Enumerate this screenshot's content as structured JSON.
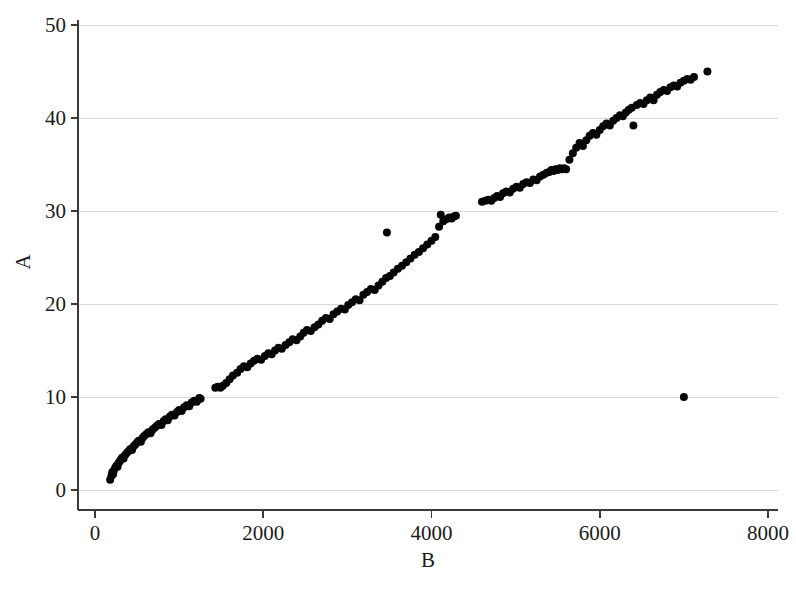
{
  "chart_data": {
    "type": "scatter",
    "title": "",
    "xlabel": "B",
    "ylabel": "A",
    "xlim": [
      0,
      8000
    ],
    "ylim": [
      0,
      50
    ],
    "xticks": [
      0,
      2000,
      4000,
      6000,
      8000
    ],
    "yticks": [
      0,
      10,
      20,
      30,
      40,
      50
    ],
    "xtick_labels": [
      "0",
      "2000",
      "4000",
      "6000",
      "8000"
    ],
    "ytick_labels": [
      "0",
      "10",
      "20",
      "30",
      "40",
      "50"
    ],
    "grid": "horizontal",
    "legend": "none",
    "marker": {
      "shape": "circle",
      "color": "#060606",
      "size_px": 8
    },
    "series": [
      {
        "name": "A vs B",
        "x": [
          180,
          195,
          205,
          215,
          225,
          240,
          255,
          268,
          280,
          295,
          310,
          325,
          340,
          360,
          380,
          400,
          420,
          440,
          460,
          480,
          500,
          520,
          545,
          565,
          585,
          610,
          635,
          660,
          685,
          710,
          735,
          760,
          790,
          815,
          840,
          865,
          890,
          915,
          945,
          975,
          1000,
          1030,
          1060,
          1090,
          1120,
          1150,
          1180,
          1210,
          1240,
          1255,
          1430,
          1460,
          1490,
          1520,
          1560,
          1600,
          1640,
          1690,
          1730,
          1770,
          1810,
          1850,
          1890,
          1930,
          1975,
          2020,
          2060,
          2100,
          2140,
          2180,
          2220,
          2265,
          2310,
          2350,
          2395,
          2440,
          2480,
          2520,
          2565,
          2610,
          2655,
          2700,
          2745,
          2790,
          2835,
          2880,
          2925,
          2970,
          3010,
          3055,
          3100,
          3145,
          3190,
          3235,
          3280,
          3325,
          3370,
          3415,
          3460,
          3470,
          3505,
          3550,
          3600,
          3650,
          3700,
          3750,
          3800,
          3850,
          3900,
          3950,
          4000,
          4045,
          4090,
          4110,
          4140,
          4175,
          4210,
          4240,
          4265,
          4290,
          4600,
          4640,
          4675,
          4710,
          4745,
          4780,
          4815,
          4850,
          4890,
          4930,
          4970,
          5010,
          5050,
          5090,
          5130,
          5170,
          5210,
          5250,
          5290,
          5330,
          5370,
          5400,
          5425,
          5450,
          5475,
          5500,
          5525,
          5550,
          5575,
          5600,
          5640,
          5680,
          5720,
          5760,
          5800,
          5840,
          5880,
          5920,
          5960,
          6000,
          6040,
          6080,
          6120,
          6160,
          6200,
          6240,
          6275,
          6310,
          6345,
          6380,
          6400,
          6440,
          6480,
          6520,
          6560,
          6600,
          6640,
          6680,
          6720,
          6760,
          6800,
          6840,
          6880,
          6920,
          6960,
          7000,
          7040,
          7080,
          7120,
          7280,
          7000
        ],
        "y": [
          1.1,
          1.5,
          1.9,
          1.7,
          2.1,
          2.4,
          2.6,
          2.5,
          2.9,
          3.1,
          3.3,
          3.5,
          3.4,
          3.8,
          4.0,
          4.2,
          4.4,
          4.3,
          4.7,
          4.9,
          5.1,
          5.3,
          5.2,
          5.6,
          5.8,
          6.0,
          6.2,
          6.1,
          6.5,
          6.7,
          6.9,
          7.1,
          7.0,
          7.4,
          7.6,
          7.5,
          7.9,
          8.1,
          8.0,
          8.4,
          8.6,
          8.5,
          8.9,
          9.1,
          9.0,
          9.4,
          9.6,
          9.5,
          9.9,
          9.8,
          11.0,
          11.1,
          11.0,
          11.2,
          11.5,
          11.9,
          12.3,
          12.6,
          13.0,
          13.3,
          13.2,
          13.6,
          13.9,
          14.1,
          14.0,
          14.4,
          14.7,
          14.6,
          15.0,
          15.3,
          15.2,
          15.6,
          15.9,
          16.2,
          16.1,
          16.5,
          16.9,
          17.2,
          17.1,
          17.5,
          17.8,
          18.2,
          18.5,
          18.4,
          18.9,
          19.2,
          19.5,
          19.4,
          19.9,
          20.2,
          20.5,
          20.4,
          21.0,
          21.3,
          21.6,
          21.5,
          22.0,
          22.4,
          22.8,
          27.7,
          23.0,
          23.4,
          23.8,
          24.1,
          24.5,
          24.9,
          25.3,
          25.6,
          26.0,
          26.4,
          26.8,
          27.2,
          28.3,
          29.6,
          28.9,
          29.1,
          29.3,
          29.2,
          29.4,
          29.5,
          31.0,
          31.1,
          31.2,
          31.1,
          31.4,
          31.6,
          31.5,
          31.9,
          32.1,
          32.0,
          32.4,
          32.6,
          32.5,
          32.9,
          33.1,
          33.0,
          33.4,
          33.3,
          33.7,
          33.9,
          34.1,
          34.2,
          34.4,
          34.3,
          34.5,
          34.4,
          34.6,
          34.5,
          34.6,
          34.5,
          35.5,
          36.2,
          36.8,
          37.3,
          37.0,
          37.6,
          38.1,
          38.4,
          38.2,
          38.7,
          39.1,
          39.4,
          39.2,
          39.7,
          40.0,
          40.3,
          40.2,
          40.6,
          40.9,
          41.1,
          39.2,
          41.4,
          41.6,
          41.5,
          41.9,
          42.2,
          41.9,
          42.5,
          42.8,
          43.0,
          42.9,
          43.3,
          43.5,
          43.4,
          43.8,
          44.0,
          44.2,
          44.1,
          44.4,
          45.0,
          10.0
        ]
      }
    ],
    "annotations": [
      {
        "label": "low outlier",
        "x": 7000,
        "y": 10.0
      },
      {
        "label": "above-trend point",
        "x": 3470,
        "y": 27.7
      },
      {
        "label": "below-trend point",
        "x": 6400,
        "y": 39.2
      }
    ]
  },
  "axes": {
    "x_title": "B",
    "y_title": "A"
  }
}
